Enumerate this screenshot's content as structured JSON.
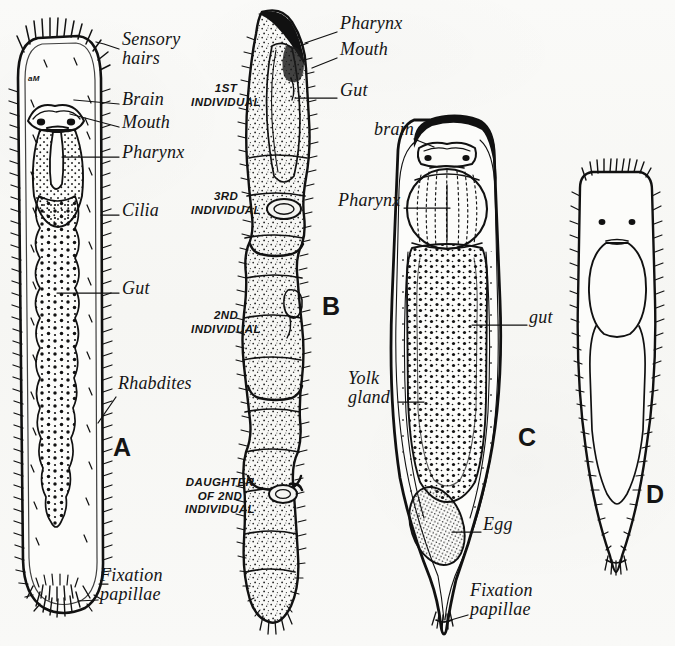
{
  "figure": {
    "caption_letters": [
      "A",
      "B",
      "C",
      "D"
    ],
    "background_color": "#f8f8f6",
    "ink_color": "#111111"
  },
  "panel_a": {
    "letter": "A",
    "letter_pos": {
      "x": 113,
      "y": 448
    },
    "inner_mark": "aM",
    "labels": [
      {
        "id": "sensory-hairs",
        "text": "Sensory\nhairs",
        "x": 122,
        "y": 38,
        "leader": [
          [
            118,
            49
          ],
          [
            104,
            44
          ],
          [
            96,
            42
          ]
        ]
      },
      {
        "id": "brain",
        "text": "Brain",
        "x": 122,
        "y": 95,
        "leader": [
          [
            119,
            105
          ],
          [
            74,
            100
          ]
        ]
      },
      {
        "id": "mouth",
        "text": "Mouth",
        "x": 122,
        "y": 118,
        "leader": [
          [
            119,
            127
          ],
          [
            70,
            114
          ]
        ]
      },
      {
        "id": "pharynx",
        "text": "Pharynx",
        "x": 122,
        "y": 148,
        "leader": [
          [
            119,
            157
          ],
          [
            62,
            157
          ]
        ]
      },
      {
        "id": "cilia",
        "text": "Cilia",
        "x": 122,
        "y": 206,
        "leader": [
          [
            119,
            215
          ],
          [
            101,
            215
          ]
        ]
      },
      {
        "id": "gut",
        "text": "Gut",
        "x": 122,
        "y": 284,
        "leader": [
          [
            119,
            293
          ],
          [
            57,
            293
          ]
        ]
      },
      {
        "id": "rhabdites",
        "text": "Rhabdites",
        "x": 118,
        "y": 380,
        "leader": [
          [
            116,
            397
          ],
          [
            98,
            423
          ]
        ]
      },
      {
        "id": "fixation-papillae",
        "text": "Fixation\npapillae",
        "x": 100,
        "y": 573,
        "leader": [
          [
            98,
            600
          ],
          [
            78,
            600
          ]
        ]
      }
    ]
  },
  "panel_b": {
    "letter": "B",
    "letter_pos": {
      "x": 322,
      "y": 307
    },
    "segment_labels": [
      {
        "id": "1st-individual",
        "text": "1ST\nINDIVIDUAL",
        "x": 187,
        "y": 88,
        "width": 78
      },
      {
        "id": "3rd-individual",
        "text": "3RD\nINDIVIDUAL",
        "x": 187,
        "y": 195,
        "width": 78
      },
      {
        "id": "2nd-individual",
        "text": "2ND\nINDIVIDUAL",
        "x": 187,
        "y": 314,
        "width": 78
      },
      {
        "id": "daughter-of-2nd-individual",
        "text": "DAUGHTER\nOF 2ND\nINDIVIDUAL",
        "x": 174,
        "y": 481,
        "width": 92
      }
    ],
    "labels": [
      {
        "id": "pharynx",
        "text": "Pharynx",
        "x": 340,
        "y": 22,
        "leader": [
          [
            337,
            33
          ],
          [
            305,
            42
          ]
        ]
      },
      {
        "id": "mouth",
        "text": "Mouth",
        "x": 340,
        "y": 47,
        "leader": [
          [
            337,
            58
          ],
          [
            312,
            68
          ]
        ]
      },
      {
        "id": "gut",
        "text": "Gut",
        "x": 340,
        "y": 88,
        "leader": [
          [
            337,
            98
          ],
          [
            295,
            98
          ]
        ]
      }
    ]
  },
  "panel_c": {
    "letter": "C",
    "letter_pos": {
      "x": 518,
      "y": 438
    },
    "labels": [
      {
        "id": "brain",
        "text": "brain",
        "x": 374,
        "y": 127,
        "leader": [
          [
            414,
            139
          ],
          [
            434,
            146
          ]
        ]
      },
      {
        "id": "pharynx",
        "text": "Pharynx",
        "x": 338,
        "y": 198,
        "leader": [
          [
            404,
            208
          ],
          [
            452,
            208
          ]
        ]
      },
      {
        "id": "gut",
        "text": "gut",
        "x": 529,
        "y": 315,
        "leader": [
          [
            527,
            325
          ],
          [
            472,
            325
          ]
        ]
      },
      {
        "id": "yolk-gland",
        "text": "Yolk\ngland",
        "x": 348,
        "y": 376,
        "leader": [
          [
            398,
            402
          ],
          [
            424,
            402
          ]
        ]
      },
      {
        "id": "egg",
        "text": "Egg",
        "x": 483,
        "y": 522,
        "leader": [
          [
            481,
            532
          ],
          [
            452,
            532
          ]
        ]
      },
      {
        "id": "fixation-papillae",
        "text": "Fixation\npapillae",
        "x": 470,
        "y": 588,
        "leader": [
          [
            468,
            615
          ],
          [
            444,
            612
          ]
        ]
      }
    ]
  },
  "panel_d": {
    "letter": "D",
    "letter_pos": {
      "x": 646,
      "y": 495
    }
  }
}
